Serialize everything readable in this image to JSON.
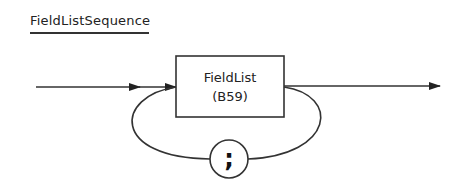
{
  "diagram": {
    "title": "FieldListSequence",
    "type": "syntax-railroad",
    "nodes": [
      {
        "id": "fieldlist",
        "kind": "nonterminal-box",
        "label_line1": "FieldList",
        "label_line2": "(B59)"
      },
      {
        "id": "separator",
        "kind": "terminal-circle",
        "label": ";"
      }
    ],
    "edges": [
      {
        "from": "entry",
        "to": "fieldlist"
      },
      {
        "from": "fieldlist",
        "to": "exit"
      },
      {
        "from": "fieldlist",
        "to": "separator",
        "note": "loop back"
      },
      {
        "from": "separator",
        "to": "fieldlist",
        "note": "repeat"
      }
    ],
    "colors": {
      "stroke": "#333333",
      "background": "#ffffff"
    }
  }
}
